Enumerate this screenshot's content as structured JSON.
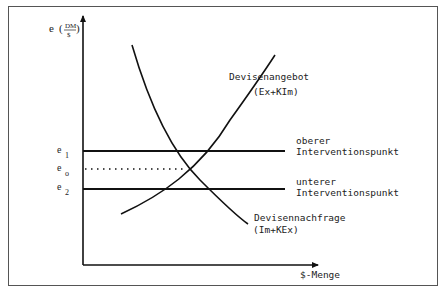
{
  "diagram": {
    "y_axis_label": {
      "symbol": "e",
      "numerator": "DM",
      "denominator": "$"
    },
    "x_axis_label": "$-Menge",
    "y_ticks": [
      {
        "symbol": "e",
        "subscript": "1"
      },
      {
        "symbol": "e",
        "subscript": "o"
      },
      {
        "symbol": "e",
        "subscript": "2"
      }
    ],
    "curves": {
      "supply": {
        "label": "Devisenangebot",
        "formula": "(Ex+KIm)"
      },
      "demand": {
        "label": "Devisennachfrage",
        "formula": "(Im+KEx)"
      }
    },
    "lines": {
      "upper": {
        "label_line1": "oberer",
        "label_line2": "Interventionspunkt"
      },
      "lower": {
        "label_line1": "unterer",
        "label_line2": "Interventionspunkt"
      }
    }
  }
}
